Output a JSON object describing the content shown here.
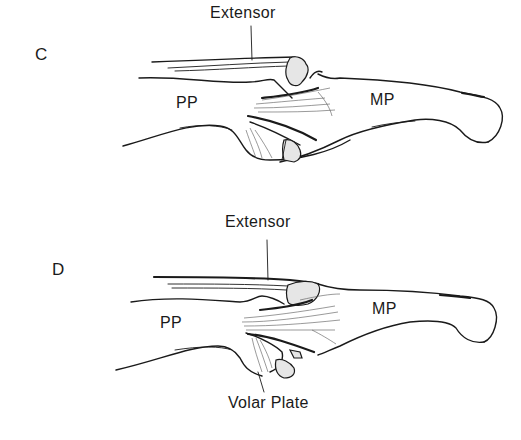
{
  "figure": {
    "panels": [
      {
        "id": "C",
        "letter": "C",
        "labels": {
          "extensor": "Extensor",
          "proximal_phalanx": "PP",
          "middle_phalanx": "MP"
        }
      },
      {
        "id": "D",
        "letter": "D",
        "labels": {
          "extensor": "Extensor",
          "proximal_phalanx": "PP",
          "middle_phalanx": "MP",
          "volar_plate": "Volar Plate"
        }
      }
    ]
  }
}
